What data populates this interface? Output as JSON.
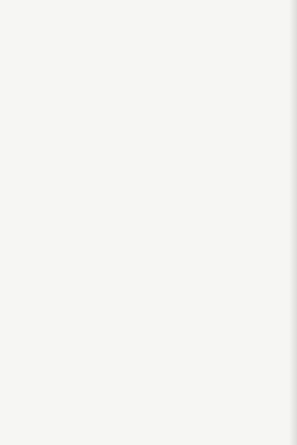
{
  "figure": {
    "background": "#f6f6f3",
    "curve_color": "#1d1d1b",
    "grid_color": "#8b8b89",
    "frame_color": "#555553",
    "text_color": "#2b2b29",
    "marker_fill": "#f6f6f3"
  },
  "chart_data": [
    {
      "type": "line",
      "panel": "top",
      "title": "",
      "ylabel": "Cake porosity",
      "xlabel": "",
      "ylim": [
        0.5,
        0.682
      ],
      "xlim": [
        0,
        65.5
      ],
      "grid": true,
      "yticks": [
        {
          "v": 0.65,
          "label": "0.65"
        },
        {
          "v": 0.6,
          "label": "0.60"
        },
        {
          "v": 0.55,
          "label": "0.55"
        },
        {
          "v": 0.5,
          "label": "0.50"
        }
      ],
      "series": [
        {
          "name": "Suspension 2",
          "marker": "square",
          "points": [
            {
              "x": 1.1,
              "y": 0.669,
              "m": "square"
            },
            {
              "x": 4.3,
              "y": 0.669,
              "m": "square"
            },
            {
              "x": 5.8,
              "y": 0.669,
              "m": "square"
            },
            {
              "x": 8.5,
              "y": 0.65,
              "m": "circle"
            },
            {
              "x": 24.8,
              "y": 0.611,
              "m": "square"
            },
            {
              "x": 40.0,
              "y": 0.588,
              "m": "square"
            },
            {
              "x": 60.0,
              "y": 0.601,
              "m": "circle"
            }
          ],
          "curve": [
            [
              2.6,
              0.682
            ],
            [
              3.5,
              0.672
            ],
            [
              5,
              0.662
            ],
            [
              7,
              0.654
            ],
            [
              8.5,
              0.65
            ],
            [
              11,
              0.643
            ],
            [
              15,
              0.633
            ],
            [
              20,
              0.622
            ],
            [
              25,
              0.613
            ],
            [
              30,
              0.606
            ],
            [
              35,
              0.601
            ],
            [
              40,
              0.597
            ],
            [
              45,
              0.594
            ],
            [
              50,
              0.592
            ],
            [
              55,
              0.59
            ],
            [
              60,
              0.589
            ],
            [
              65,
              0.588
            ]
          ],
          "label": {
            "text": "Suspension 2",
            "px": 228,
            "py": 81,
            "rotate": 6,
            "leader": [
              [
                256,
                83.5
              ],
              [
                262.5,
                85.5
              ]
            ]
          }
        },
        {
          "name": "Suspension 1",
          "marker": "circle",
          "points": [
            {
              "x": 1.2,
              "y": 0.65,
              "m": "circle"
            },
            {
              "x": 4.6,
              "y": 0.578,
              "m": "circle"
            },
            {
              "x": 6.8,
              "y": 0.559,
              "m": "circle"
            },
            {
              "x": 8.8,
              "y": 0.569,
              "m": "circle"
            },
            {
              "x": 24.9,
              "y": 0.54,
              "m": "circle"
            },
            {
              "x": 40.2,
              "y": 0.542,
              "m": "circle"
            },
            {
              "x": 60.3,
              "y": 0.513,
              "m": "circle"
            }
          ],
          "curve": [
            [
              1.2,
              0.65
            ],
            [
              1.6,
              0.632
            ],
            [
              2.2,
              0.614
            ],
            [
              3,
              0.599
            ],
            [
              4,
              0.588
            ],
            [
              5,
              0.58
            ],
            [
              6.3,
              0.572
            ],
            [
              8,
              0.566
            ],
            [
              10,
              0.561
            ],
            [
              13,
              0.556
            ],
            [
              17,
              0.551
            ],
            [
              21,
              0.547
            ],
            [
              25,
              0.544
            ],
            [
              30,
              0.54
            ],
            [
              35,
              0.536
            ],
            [
              40,
              0.532
            ],
            [
              45,
              0.528
            ],
            [
              50,
              0.524
            ],
            [
              55,
              0.519
            ],
            [
              60,
              0.514
            ],
            [
              63,
              0.511
            ]
          ],
          "label": {
            "text": "Suspension 1",
            "px": 233,
            "py": 147,
            "rotate": 11,
            "leader": null
          }
        }
      ]
    },
    {
      "type": "line",
      "panel": "bottom",
      "title": "",
      "ylabel": "Cake permeability, in 10⁻³ millidarcies",
      "xlabel": "Filtration pressure, atmospheres",
      "ylim": [
        0,
        55.9
      ],
      "xlim": [
        0,
        65.5
      ],
      "grid": true,
      "yticks": [
        {
          "v": 50,
          "label": "50"
        },
        {
          "v": 40,
          "label": "40"
        },
        {
          "v": 30,
          "label": "30"
        },
        {
          "v": 20,
          "label": "20"
        },
        {
          "v": 10,
          "label": "10"
        },
        {
          "v": 0,
          "label": "0"
        }
      ],
      "xticks": [
        {
          "v": 10,
          "label": "10"
        },
        {
          "v": 20,
          "label": "20"
        },
        {
          "v": 30,
          "label": "30"
        },
        {
          "v": 40,
          "label": "40"
        },
        {
          "v": 50,
          "label": "50"
        },
        {
          "v": 60,
          "label": "60"
        }
      ],
      "series": [
        {
          "name": "Suspension 2",
          "marker": "square",
          "points": [
            {
              "x": 1.3,
              "y": 51.7,
              "m": "square"
            },
            {
              "x": 4.4,
              "y": 29.5,
              "m": "square"
            },
            {
              "x": 6.7,
              "y": 21.3,
              "m": "square"
            },
            {
              "x": 9.2,
              "y": 17.3,
              "m": "square"
            },
            {
              "x": 24.3,
              "y": 6.4,
              "m": "square"
            },
            {
              "x": 40.0,
              "y": 4.3,
              "m": "circle"
            },
            {
              "x": 60.3,
              "y": 3.8,
              "m": "square"
            }
          ],
          "curve": [
            [
              1.3,
              53.5
            ],
            [
              1.8,
              47
            ],
            [
              2.5,
              40
            ],
            [
              3.3,
              34.5
            ],
            [
              4.4,
              29.3
            ],
            [
              5.5,
              25.3
            ],
            [
              6.7,
              21.7
            ],
            [
              8,
              18.9
            ],
            [
              9,
              17.2
            ],
            [
              11,
              14.2
            ],
            [
              13,
              12.2
            ],
            [
              16,
              10.1
            ],
            [
              20,
              8.2
            ],
            [
              25,
              6.6
            ],
            [
              30,
              5.7
            ],
            [
              35,
              5.0
            ],
            [
              40,
              4.5
            ],
            [
              45,
              4.2
            ],
            [
              50,
              4.0
            ],
            [
              55,
              3.9
            ],
            [
              60,
              3.8
            ],
            [
              65,
              3.7
            ]
          ],
          "label": {
            "text": "Suspension 2",
            "px": 228,
            "py": 388,
            "rotate": 0,
            "leader": null
          }
        },
        {
          "name": "Suspension 1",
          "marker": "circle",
          "points": [
            {
              "x": 0.8,
              "y": 13.7,
              "m": "circle"
            },
            {
              "x": 3.6,
              "y": 6.4,
              "m": "circle"
            },
            {
              "x": 5.9,
              "y": 4.7,
              "m": "circle"
            },
            {
              "x": 9.5,
              "y": 3.2,
              "m": "circle"
            },
            {
              "x": 24.7,
              "y": 1.4,
              "m": "circle"
            },
            {
              "x": 40.2,
              "y": 1.2,
              "m": "circle"
            },
            {
              "x": 60.0,
              "y": 1.0,
              "m": "circle"
            }
          ],
          "curve": [
            [
              0.9,
              14.0
            ],
            [
              1.6,
              11.8
            ],
            [
              2.3,
              9.7
            ],
            [
              3.2,
              7.8
            ],
            [
              4.2,
              6.3
            ],
            [
              5.5,
              5.2
            ],
            [
              7,
              4.3
            ],
            [
              9,
              3.5
            ],
            [
              11,
              3.0
            ],
            [
              14,
              2.5
            ],
            [
              18,
              2.1
            ],
            [
              25,
              1.7
            ],
            [
              32,
              1.45
            ],
            [
              40,
              1.3
            ],
            [
              50,
              1.15
            ],
            [
              60,
              1.0
            ],
            [
              65,
              0.95
            ]
          ],
          "label": {
            "text": "Suspension 1",
            "px": 228,
            "py": 400.5,
            "rotate": 0,
            "leader": null
          }
        }
      ]
    }
  ]
}
